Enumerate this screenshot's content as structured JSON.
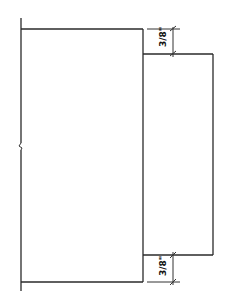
{
  "drawing": {
    "title": "",
    "stroke_color": "#2a2a2a",
    "main_rect": {
      "x": 21,
      "y": 29,
      "width": 122,
      "height": 253
    },
    "offset_rect": {
      "x": 143,
      "y": 54,
      "width": 70,
      "height": 201
    },
    "dimensions": [
      {
        "name": "top-offset",
        "label": "3/8\"",
        "from_y": 29,
        "to_y": 54,
        "x": 173
      },
      {
        "name": "bottom-offset",
        "label": "3/8\"",
        "from_y": 255,
        "to_y": 282,
        "x": 173
      }
    ]
  }
}
